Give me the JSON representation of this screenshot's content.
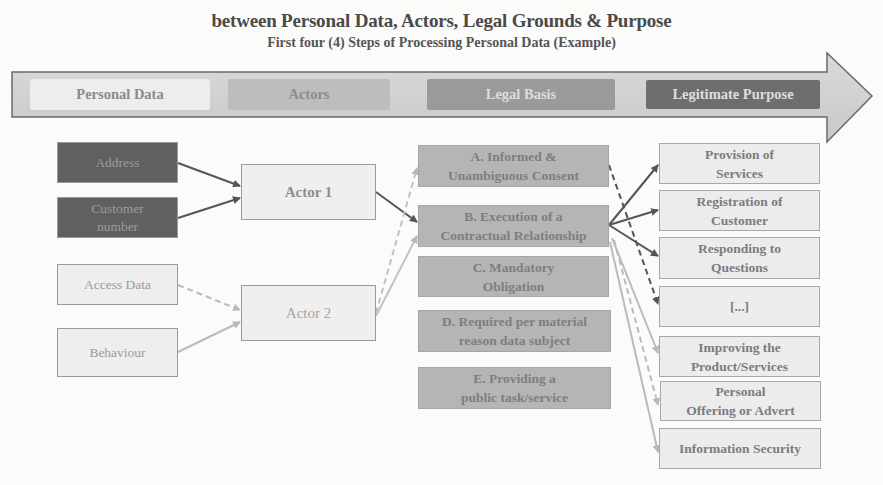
{
  "title": {
    "line1": "between Personal Data, Actors, Legal Grounds & Purpose",
    "line2": "First four (4) Steps of Processing Personal Data (Example)"
  },
  "process_arrow": {
    "stages": [
      {
        "label": "Personal Data",
        "color": "#ededed",
        "text_color": "#8a8a8a"
      },
      {
        "label": "Actors",
        "color": "#bdbdbd",
        "text_color": "#8c8c8c"
      },
      {
        "label": "Legal Basis",
        "color": "#9a9a9a",
        "text_color": "#dcdcdc"
      },
      {
        "label": "Legitimate Purpose",
        "color": "#6e6e6e",
        "text_color": "#dedede"
      }
    ],
    "arrow_color": "#cfcfcf"
  },
  "personal_data": [
    {
      "label": "Address",
      "style": "dark"
    },
    {
      "label": "Customer number",
      "style": "dark"
    },
    {
      "label": "Access Data",
      "style": "light"
    },
    {
      "label": "Behaviour",
      "style": "light"
    }
  ],
  "actors": [
    {
      "label": "Actor 1"
    },
    {
      "label": "Actor 2"
    }
  ],
  "legal_basis": [
    {
      "label": "A. Informed & Unambiguous Consent",
      "line1": "A. Informed &",
      "line2": "Unambiguous Consent"
    },
    {
      "label": "B. Execution of a Contractual Relationship",
      "line1": "B. Execution of a",
      "line2": "Contractual Relationship"
    },
    {
      "label": "C. Mandatory Obligation",
      "line1": "C. Mandatory",
      "line2": "Obligation"
    },
    {
      "label": "D. Required per material reason data subject",
      "line1": "D. Required per material",
      "line2": "reason data subject"
    },
    {
      "label": "E. Providing a public task/service",
      "line1": "E. Providing a",
      "line2": "public task/service"
    }
  ],
  "purposes": [
    {
      "label": "Provision of Services",
      "line1": "Provision of",
      "line2": "Services"
    },
    {
      "label": "Registration of Customer",
      "line1": "Registration of",
      "line2": "Customer"
    },
    {
      "label": "Responding to Questions",
      "line1": "Responding to",
      "line2": "Questions"
    },
    {
      "label": "[...]",
      "line1": "[...]",
      "line2": ""
    },
    {
      "label": "Improving the Product/Services",
      "line1": "Improving the",
      "line2": "Product/Services"
    },
    {
      "label": "Personal Offering or Advert",
      "line1": "Personal",
      "line2": "Offering or Advert"
    },
    {
      "label": "Information Security",
      "line1": "Information Security",
      "line2": ""
    }
  ],
  "connections": [
    {
      "from": "Address",
      "to": "Actor 1",
      "style": "solid-dark"
    },
    {
      "from": "Customer number",
      "to": "Actor 1",
      "style": "solid-dark"
    },
    {
      "from": "Access Data",
      "to": "Actor 2",
      "style": "dashed-light"
    },
    {
      "from": "Behaviour",
      "to": "Actor 2",
      "style": "solid-light"
    },
    {
      "from": "Actor 1",
      "to": "B. Execution of a Contractual Relationship",
      "style": "solid-dark"
    },
    {
      "from": "Actor 2",
      "to": "A. Informed & Unambiguous Consent",
      "style": "dashed-light"
    },
    {
      "from": "Actor 2",
      "to": "B. Execution of a Contractual Relationship",
      "style": "solid-light"
    },
    {
      "from": "B. Execution of a Contractual Relationship",
      "to": "Provision of Services",
      "style": "solid-dark"
    },
    {
      "from": "B. Execution of a Contractual Relationship",
      "to": "Registration of Customer",
      "style": "solid-dark"
    },
    {
      "from": "B. Execution of a Contractual Relationship",
      "to": "Responding to Questions",
      "style": "solid-dark"
    },
    {
      "from": "A. Informed & Unambiguous Consent",
      "to": "[...]",
      "style": "dashed-dark"
    },
    {
      "from": "B. Execution of a Contractual Relationship",
      "to": "Improving the Product/Services",
      "style": "solid-light"
    },
    {
      "from": "B. Execution of a Contractual Relationship",
      "to": "Personal Offering or Advert",
      "style": "dashed-light"
    },
    {
      "from": "B. Execution of a Contractual Relationship",
      "to": "Information Security",
      "style": "solid-light"
    }
  ]
}
